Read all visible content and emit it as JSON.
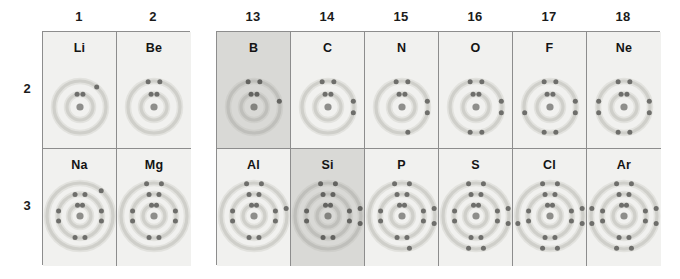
{
  "figure": {
    "type": "periodic-table-bohr-models",
    "background_color": "#ffffff",
    "cell_background": "#f1f1ef",
    "cell_background_highlighted": "#d9d9d6",
    "border_color": "#8d8d8d",
    "nucleus_color": "#8e8e8b",
    "electron_color": "#6e6e6b",
    "shell_color": "#cfcfca"
  },
  "column_headers": [
    {
      "label": "1",
      "block": "left",
      "index": 0
    },
    {
      "label": "2",
      "block": "left",
      "index": 1
    },
    {
      "label": "13",
      "block": "right",
      "index": 0
    },
    {
      "label": "14",
      "block": "right",
      "index": 1
    },
    {
      "label": "15",
      "block": "right",
      "index": 2
    },
    {
      "label": "16",
      "block": "right",
      "index": 3
    },
    {
      "label": "17",
      "block": "right",
      "index": 4
    },
    {
      "label": "18",
      "block": "right",
      "index": 5
    }
  ],
  "row_labels": [
    {
      "label": "2"
    },
    {
      "label": "3"
    }
  ],
  "chart_data": {
    "type": "table",
    "title": "",
    "rows": [
      {
        "period": "2",
        "cells": [
          {
            "symbol": "Li",
            "group": "1",
            "shells": [
              2,
              1
            ],
            "highlighted": false
          },
          {
            "symbol": "Be",
            "group": "2",
            "shells": [
              2,
              2
            ],
            "highlighted": false
          },
          {
            "symbol": "B",
            "group": "13",
            "shells": [
              2,
              3
            ],
            "highlighted": true
          },
          {
            "symbol": "C",
            "group": "14",
            "shells": [
              2,
              4
            ],
            "highlighted": false
          },
          {
            "symbol": "N",
            "group": "15",
            "shells": [
              2,
              5
            ],
            "highlighted": false
          },
          {
            "symbol": "O",
            "group": "16",
            "shells": [
              2,
              6
            ],
            "highlighted": false
          },
          {
            "symbol": "F",
            "group": "17",
            "shells": [
              2,
              7
            ],
            "highlighted": false
          },
          {
            "symbol": "Ne",
            "group": "18",
            "shells": [
              2,
              8
            ],
            "highlighted": false
          }
        ]
      },
      {
        "period": "3",
        "cells": [
          {
            "symbol": "Na",
            "group": "1",
            "shells": [
              2,
              8,
              1
            ],
            "highlighted": false
          },
          {
            "symbol": "Mg",
            "group": "2",
            "shells": [
              2,
              8,
              2
            ],
            "highlighted": false
          },
          {
            "symbol": "Al",
            "group": "13",
            "shells": [
              2,
              8,
              3
            ],
            "highlighted": false
          },
          {
            "symbol": "Si",
            "group": "14",
            "shells": [
              2,
              8,
              4
            ],
            "highlighted": true
          },
          {
            "symbol": "P",
            "group": "15",
            "shells": [
              2,
              8,
              5
            ],
            "highlighted": false
          },
          {
            "symbol": "S",
            "group": "16",
            "shells": [
              2,
              8,
              6
            ],
            "highlighted": false
          },
          {
            "symbol": "Cl",
            "group": "17",
            "shells": [
              2,
              8,
              7
            ],
            "highlighted": false
          },
          {
            "symbol": "Ar",
            "group": "18",
            "shells": [
              2,
              8,
              8
            ],
            "highlighted": false
          }
        ]
      }
    ]
  }
}
